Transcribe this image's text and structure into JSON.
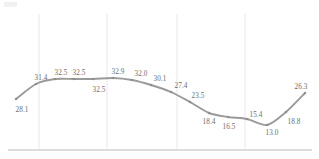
{
  "chart_data": {
    "type": "line",
    "title": "",
    "subtitle": "",
    "xlabel": "",
    "ylabel": "",
    "categories": [
      "1",
      "2",
      "3",
      "4",
      "5",
      "6",
      "7",
      "8",
      "9",
      "10",
      "11",
      "12",
      "13",
      "14",
      "15",
      "16"
    ],
    "values": [
      28.1,
      31.4,
      32.5,
      32.5,
      32.5,
      32.9,
      32.0,
      30.1,
      27.4,
      23.5,
      18.4,
      16.5,
      15.4,
      13.0,
      18.8,
      26.3
    ],
    "series": [
      {
        "name": "series-1",
        "values": [
          28.1,
          31.4,
          32.5,
          32.5,
          32.5,
          32.9,
          32.0,
          30.1,
          27.4,
          23.5,
          18.4,
          16.5,
          15.4,
          13.0,
          18.8,
          26.3
        ],
        "color": "#9a9a9a",
        "marker": "square"
      }
    ],
    "data_labels": [
      {
        "value": "28.1",
        "x": 22,
        "y": 107,
        "position": "below"
      },
      {
        "value": "31.4",
        "x": 41,
        "y": 75,
        "position": "above"
      },
      {
        "value": "32.5",
        "x": 61,
        "y": 70,
        "position": "above"
      },
      {
        "value": "32.5",
        "x": 79,
        "y": 70,
        "position": "above"
      },
      {
        "value": "32.5",
        "x": 99,
        "y": 87,
        "position": "below"
      },
      {
        "value": "32.9",
        "x": 118,
        "y": 69,
        "position": "above"
      },
      {
        "value": "32.0",
        "x": 141,
        "y": 71,
        "position": "above"
      },
      {
        "value": "30.1",
        "x": 160,
        "y": 76,
        "position": "above"
      },
      {
        "value": "27.4",
        "x": 181,
        "y": 83,
        "position": "above"
      },
      {
        "value": "23.5",
        "x": 198,
        "y": 93,
        "position": "above"
      },
      {
        "value": "18.4",
        "x": 209,
        "y": 119,
        "position": "below"
      },
      {
        "value": "16.5",
        "x": 229,
        "y": 124,
        "position": "below"
      },
      {
        "value": "15.4",
        "x": 256,
        "y": 112,
        "position": "above"
      },
      {
        "value": "13.0",
        "x": 272,
        "y": 130,
        "position": "below"
      },
      {
        "value": "18.8",
        "x": 294,
        "y": 119,
        "position": "below"
      },
      {
        "value": "26.3",
        "x": 301,
        "y": 84,
        "position": "above"
      }
    ],
    "points": [
      {
        "x": 16,
        "y": 99
      },
      {
        "x": 36,
        "y": 84
      },
      {
        "x": 55,
        "y": 79
      },
      {
        "x": 74,
        "y": 79
      },
      {
        "x": 93,
        "y": 79
      },
      {
        "x": 113,
        "y": 78
      },
      {
        "x": 132,
        "y": 80
      },
      {
        "x": 151,
        "y": 85
      },
      {
        "x": 171,
        "y": 92
      },
      {
        "x": 190,
        "y": 102
      },
      {
        "x": 209,
        "y": 113
      },
      {
        "x": 228,
        "y": 117
      },
      {
        "x": 247,
        "y": 119
      },
      {
        "x": 267,
        "y": 125
      },
      {
        "x": 286,
        "y": 112
      },
      {
        "x": 305,
        "y": 93
      }
    ],
    "gridlines": {
      "vertical": [
        39,
        107,
        177,
        245
      ],
      "horizontal": [],
      "color": "#e8e8e8",
      "grid": true
    },
    "axis": {
      "baseline_y": 150,
      "baseline_x_start": 8,
      "baseline_x_end": 312,
      "color": "#b9b9b9"
    },
    "ylim": [
      0,
      40
    ],
    "legend": {
      "visible": false,
      "position": "none"
    },
    "tick_labels": {
      "x": [],
      "y": []
    },
    "colors": {
      "line": "#9a9a9a",
      "marker": "#8f8f8f",
      "label_text": "#6b6b6b",
      "gridline": "#e8e8e8",
      "axis": "#b9b9b9",
      "background": "#ffffff"
    }
  }
}
